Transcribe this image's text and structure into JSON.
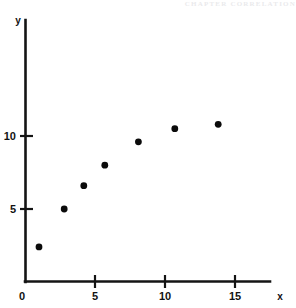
{
  "header": {
    "faint_text": "CHAPTER  CORRELATION"
  },
  "chart_data": {
    "type": "scatter",
    "title": "",
    "subtitle": "",
    "xlabel": "x",
    "ylabel": "y",
    "xlim": [
      0,
      17.5
    ],
    "ylim": [
      0,
      18
    ],
    "grid": false,
    "legend": null,
    "x_ticks": [
      0,
      5,
      10,
      15
    ],
    "x_tick_labels": [
      "0",
      "5",
      "10",
      "15"
    ],
    "y_ticks": [
      5,
      10
    ],
    "y_tick_labels": [
      "5",
      "10"
    ],
    "origin_label": "0",
    "marker": "filled-circle",
    "marker_color": "#0b0b0b",
    "axis_color": "#141414",
    "background_color": "#ffffff",
    "points": [
      {
        "x": 1.0,
        "y": 2.4
      },
      {
        "x": 2.8,
        "y": 5.0
      },
      {
        "x": 4.2,
        "y": 6.6
      },
      {
        "x": 5.7,
        "y": 8.0
      },
      {
        "x": 8.1,
        "y": 9.6
      },
      {
        "x": 10.7,
        "y": 10.5
      },
      {
        "x": 13.8,
        "y": 10.8
      }
    ],
    "x": [
      1.0,
      2.8,
      4.2,
      5.7,
      8.1,
      10.7,
      13.8
    ],
    "values": [
      2.4,
      5.0,
      6.6,
      8.0,
      9.6,
      10.5,
      10.8
    ]
  }
}
